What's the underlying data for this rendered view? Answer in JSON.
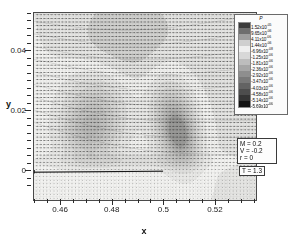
{
  "figure": {
    "type": "cfd-vector-contour-plot",
    "background": "#ffffff"
  },
  "axes": {
    "x": {
      "title": "x",
      "ticks": [
        "0.46",
        "0.48",
        "0.5",
        "0.52"
      ],
      "tick_positions": [
        0.46,
        0.48,
        0.5,
        0.52
      ],
      "range": [
        0.4495,
        0.5355
      ]
    },
    "y": {
      "title": "y",
      "ticks": [
        "0.04",
        "0.02",
        "0"
      ],
      "tick_positions": [
        0.04,
        0.02,
        0.0
      ],
      "range": [
        -0.0095,
        0.0527
      ]
    }
  },
  "legend": {
    "title": "P",
    "entries": [
      {
        "value": "1.52x10",
        "exp": "-05",
        "color": "#3a3a3a"
      },
      {
        "value": "9.65x10",
        "exp": "-06",
        "color": "#6e6e6e"
      },
      {
        "value": "4.11x10",
        "exp": "-06",
        "color": "#9e9e9e"
      },
      {
        "value": "1.44x10",
        "exp": "-06",
        "color": "#cfcfcf"
      },
      {
        "value": "-6.96x10",
        "exp": "-08",
        "color": "#efefef"
      },
      {
        "value": "-1.25x10",
        "exp": "-06",
        "color": "#d8d8d8"
      },
      {
        "value": "-1.81x10",
        "exp": "-06",
        "color": "#bdbdbd"
      },
      {
        "value": "-2.36x10",
        "exp": "-06",
        "color": "#a6a6a6"
      },
      {
        "value": "-2.92x10",
        "exp": "-06",
        "color": "#8e8e8e"
      },
      {
        "value": "-3.47x10",
        "exp": "-06",
        "color": "#797979"
      },
      {
        "value": "-4.03x10",
        "exp": "-06",
        "color": "#636363"
      },
      {
        "value": "-4.58x10",
        "exp": "-06",
        "color": "#4d4d4d"
      },
      {
        "value": "-5.14x10",
        "exp": "-06",
        "color": "#353535"
      },
      {
        "value": "-5.69x10",
        "exp": "-06",
        "color": "#121212"
      }
    ]
  },
  "parameters": {
    "lines": [
      "M =  0.2",
      "V = -0.2",
      "r  = 0"
    ]
  },
  "time": {
    "label": "T = 1.3"
  },
  "chart_data": {
    "type": "heatmap",
    "title": "",
    "xlabel": "x",
    "ylabel": "y",
    "xlim": [
      0.4495,
      0.5355
    ],
    "ylim": [
      -0.0095,
      0.0527
    ],
    "xticks": [
      0.46,
      0.48,
      0.5,
      0.52
    ],
    "yticks": [
      0.0,
      0.02,
      0.04
    ],
    "grid": false,
    "legend_position": "top-right",
    "colorbar_label": "P",
    "colorbar_values": [
      1.52e-05,
      9.65e-06,
      4.11e-06,
      1.44e-06,
      -6.96e-08,
      -1.25e-06,
      -1.81e-06,
      -2.36e-06,
      -2.92e-06,
      -3.47e-06,
      -4.03e-06,
      -4.58e-06,
      -5.14e-06,
      -5.69e-06
    ],
    "overlays": [
      "velocity-vector-field",
      "pressure-contour-flood",
      "flat-plate-wall"
    ],
    "wall": {
      "y": 0.0,
      "x_start": 0.4495,
      "x_end": 0.4995
    },
    "annotations": [
      {
        "text": "M =  0.2"
      },
      {
        "text": "V = -0.2"
      },
      {
        "text": "r  = 0"
      },
      {
        "text": "T = 1.3"
      }
    ]
  }
}
